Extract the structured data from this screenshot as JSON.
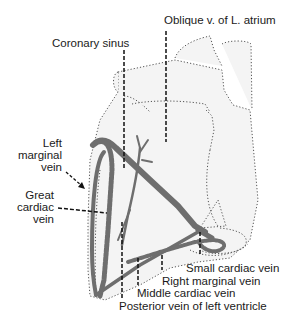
{
  "figure": {
    "labels": {
      "oblique_vein": "Oblique v. of L. atrium",
      "coronary_sinus": "Coronary sinus",
      "left_marginal_vein_1": "Left",
      "left_marginal_vein_2": "marginal",
      "left_marginal_vein_3": "vein",
      "great_cardiac_vein_1": "Great",
      "great_cardiac_vein_2": "cardiac",
      "great_cardiac_vein_3": "vein",
      "small_cardiac_vein": "Small cardiac vein",
      "right_marginal_vein": "Right marginal vein",
      "middle_cardiac_vein": "Middle cardiac vein",
      "posterior_vein_lv": "Posterior vein of left ventricle"
    },
    "colors": {
      "vein": "#6e6e6e",
      "outline": "#555555",
      "heart_fill": "#f4f4f4",
      "leader": "#111111",
      "text": "#1a1a1a"
    }
  }
}
